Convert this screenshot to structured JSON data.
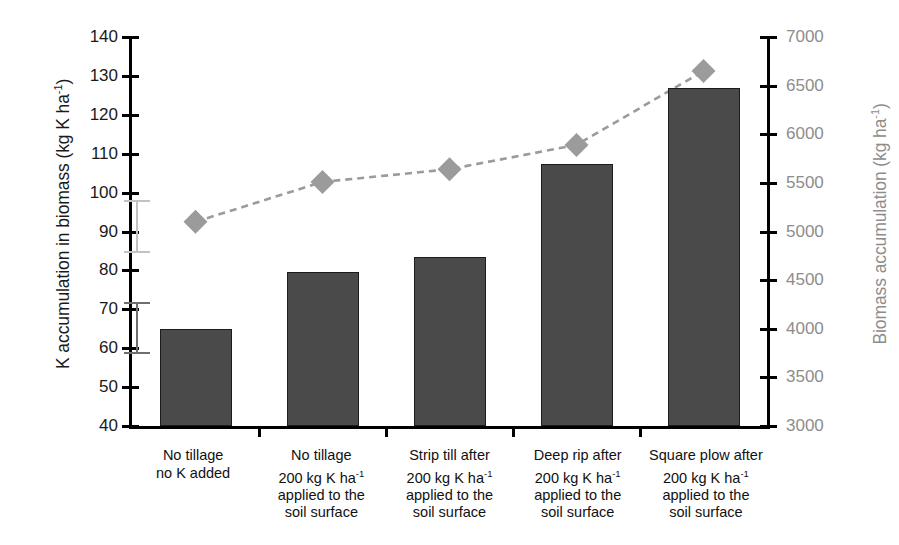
{
  "chart_data": {
    "type": "bar",
    "title": "",
    "categories": [
      "No tillage\nno K added",
      "No tillage\n200 kg K ha⁻¹\napplied to the\nsoil surface",
      "Strip till after\n200 kg K ha⁻¹\napplied to the\nsoil surface",
      "Deep rip after\n200 kg K ha⁻¹\napplied to the\nsoil surface",
      "Square plow after\n200 kg K ha⁻¹\napplied to the\nsoil surface"
    ],
    "xlabel": "",
    "series": [
      {
        "name": "K accumulation in biomass",
        "type": "bar",
        "axis": "left",
        "color": "#4a4a4a",
        "values": [
          65.0,
          79.7,
          83.5,
          107.3,
          127.0
        ],
        "errors": [
          {
            "category_index": 0,
            "low": 58.6,
            "high": 72.0,
            "color": "#6e6e6e"
          },
          {
            "category_index": 0,
            "low": 84.6,
            "high": 98.0,
            "color": "#c2c2c2",
            "note": "upper light-grey error bar"
          }
        ]
      },
      {
        "name": "Biomass accumulation",
        "type": "line",
        "axis": "right",
        "color": "#9b9b9b",
        "marker": "diamond",
        "linestyle": "dashed",
        "values": [
          5100,
          5510,
          5640,
          5890,
          6650
        ]
      }
    ],
    "y_left": {
      "label": "K accumulation in biomass  (kg K ha⁻¹)",
      "ticks": [
        140,
        130,
        120,
        110,
        100,
        90,
        80,
        70,
        60,
        50,
        40
      ],
      "ylim": [
        40,
        140
      ],
      "color": "#1a1a1a"
    },
    "y_right": {
      "label": "Biomass accumulation (kg ha⁻¹)",
      "ticks": [
        7000,
        6500,
        6000,
        5500,
        5000,
        4500,
        4000,
        3500,
        3000
      ],
      "ylim": [
        3000,
        7000
      ],
      "color": "#8d8d8d"
    },
    "grid": false,
    "legend": "none"
  },
  "axis_titles": {
    "left_main": "K accumulation in biomass  (kg K ha",
    "left_sup": "-1",
    "left_tail": ")",
    "right_main": "Biomass accumulation (kg ha",
    "right_sup": "-1",
    "right_tail": ")"
  },
  "colors": {
    "bar_fill": "#4a4a4a",
    "bar_stroke": "#1c1c1c",
    "line_marker": "#9b9b9b",
    "error_dark": "#6e6e6e",
    "error_light": "#c2c2c2",
    "left_axis_text": "#1a1a1a",
    "right_axis_text": "#8d8d8d",
    "background": "#ffffff"
  }
}
